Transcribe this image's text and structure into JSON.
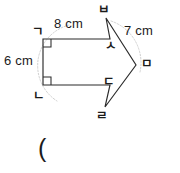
{
  "figure": {
    "kind": "geometry-diagram",
    "stroke_color": "#2b2b2b",
    "arc_color": "#c9c9c9",
    "background": "#ffffff",
    "dimensions": [
      {
        "id": "top",
        "value": "8 cm",
        "edge": "ㄱ-ㅅ"
      },
      {
        "id": "left",
        "value": "6 cm",
        "edge": "ㄱ-ㄴ"
      },
      {
        "id": "diagonal",
        "value": "7 cm",
        "edge": "ㅂ-ㅁ"
      }
    ],
    "vertices": [
      {
        "id": "g",
        "label": "ㄱ",
        "x": 43,
        "y": 39,
        "right_angle": true
      },
      {
        "id": "n",
        "label": "ㄴ",
        "x": 43,
        "y": 85,
        "right_angle": true
      },
      {
        "id": "b",
        "label": "ㅂ",
        "x": 106,
        "y": 18,
        "right_angle": false
      },
      {
        "id": "s",
        "label": "ㅅ",
        "x": 110,
        "y": 39,
        "right_angle": false
      },
      {
        "id": "d",
        "label": "ㄷ",
        "x": 110,
        "y": 85,
        "right_angle": false
      },
      {
        "id": "m",
        "label": "ㅁ",
        "x": 136,
        "y": 65,
        "right_angle": false
      },
      {
        "id": "r",
        "label": "ㄹ",
        "x": 105,
        "y": 107,
        "right_angle": false
      }
    ],
    "outline_path": "M43,39 L110,39 L106,18 L136,65 L105,107 L110,85 L43,85 Z",
    "arcs": [
      {
        "id": "left-arc",
        "path": "M69,25 A42,42 0 0 0 57,101"
      },
      {
        "id": "right-arc",
        "path": "M111,21 A44,44 0 0 1 140,72"
      }
    ],
    "caption": "("
  }
}
